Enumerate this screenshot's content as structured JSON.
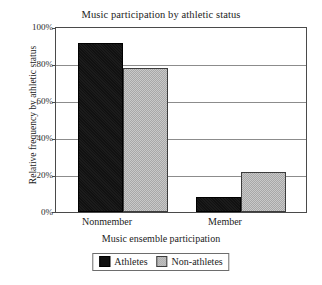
{
  "chart_data": {
    "type": "bar",
    "title": "Music participation by athletic status",
    "xlabel": "Music ensemble participation",
    "ylabel": "Relative frequency by athletic status",
    "categories": [
      "Nonmember",
      "Member"
    ],
    "series": [
      {
        "name": "Athletes",
        "values": [
          92,
          8
        ],
        "color": "#111111"
      },
      {
        "name": "Non-athletes",
        "values": [
          78,
          22
        ],
        "color": "#b9b9b9"
      }
    ],
    "ylim": [
      0,
      100
    ],
    "yticks": [
      0,
      20,
      40,
      60,
      80,
      100
    ],
    "ytick_labels": [
      "0%",
      "20%",
      "40%",
      "60%",
      "80%",
      "100%"
    ],
    "grid": "horizontal",
    "legend_position": "below-axis-centered"
  },
  "axes": {
    "y_ticks": [
      {
        "label": "100%",
        "value": 100
      },
      {
        "label": "80%",
        "value": 80
      },
      {
        "label": "60%",
        "value": 60
      },
      {
        "label": "40%",
        "value": 40
      },
      {
        "label": "20%",
        "value": 20
      },
      {
        "label": "0%",
        "value": 0
      }
    ],
    "x_ticks": [
      {
        "label": "Nonmember"
      },
      {
        "label": "Member"
      }
    ]
  },
  "legend": {
    "entries": [
      {
        "label": "Athletes",
        "swatch": "black-square-swatch"
      },
      {
        "label": "Non-athletes",
        "swatch": "gray-square-swatch"
      }
    ]
  }
}
